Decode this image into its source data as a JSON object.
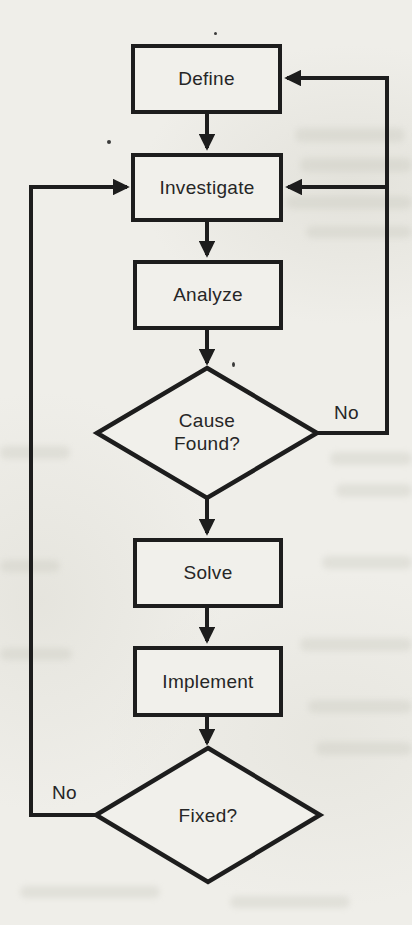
{
  "flowchart": {
    "nodes": {
      "define": {
        "label": "Define"
      },
      "investigate": {
        "label": "Investigate"
      },
      "analyze": {
        "label": "Analyze"
      },
      "cause_found": {
        "label_line1": "Cause",
        "label_line2": "Found?"
      },
      "solve": {
        "label": "Solve"
      },
      "implement": {
        "label": "Implement"
      },
      "fixed": {
        "label": "Fixed?"
      }
    },
    "edge_labels": {
      "cause_found_no": "No",
      "fixed_no": "No"
    },
    "colors": {
      "line": "#1d1d1d",
      "paper": "#efeee9",
      "text": "#262626"
    }
  }
}
